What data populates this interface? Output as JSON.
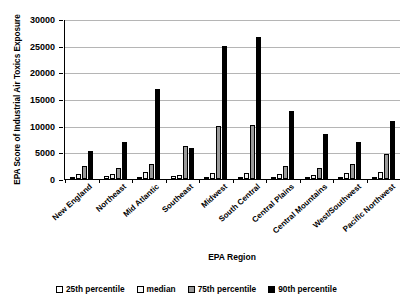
{
  "chart_data": {
    "type": "bar",
    "title": "",
    "xlabel": "EPA Region",
    "ylabel": "EPA Score of Industrial Air Toxics Exposure",
    "ylim": [
      0,
      30000
    ],
    "yticks": [
      0,
      5000,
      10000,
      15000,
      20000,
      25000,
      30000
    ],
    "ytick_labels": [
      "0",
      "5000",
      "10000",
      "15000",
      "20000",
      "25000",
      "30000"
    ],
    "grid": true,
    "legend_position": "bottom",
    "categories": [
      "New England",
      "Northeast",
      "Mid Atlantic",
      "Southeast",
      "Midwest",
      "South Central",
      "Central Plains",
      "Central Mountains",
      "West/Southwest",
      "Pacific Northwest"
    ],
    "series": [
      {
        "name": "25th percentile",
        "color": "#ffffff",
        "values": [
          400,
          600,
          400,
          500,
          200,
          300,
          400,
          200,
          300,
          400
        ]
      },
      {
        "name": "median",
        "color": "#f2f2f2",
        "values": [
          900,
          1000,
          1300,
          800,
          1100,
          1200,
          1000,
          800,
          1200,
          1300
        ]
      },
      {
        "name": "75th percentile",
        "color": "#9a9a9a",
        "values": [
          2400,
          2100,
          2800,
          6100,
          10000,
          10100,
          2500,
          2000,
          2800,
          4700
        ]
      },
      {
        "name": "90th percentile",
        "color": "#000000",
        "values": [
          5300,
          7000,
          16900,
          5800,
          25000,
          26700,
          12800,
          8500,
          6900,
          10800
        ]
      }
    ]
  },
  "legend": {
    "items": [
      {
        "label": "25th percentile",
        "swatch": "p25"
      },
      {
        "label": "median",
        "swatch": "med"
      },
      {
        "label": "75th percentile",
        "swatch": "p75"
      },
      {
        "label": "90th percentile",
        "swatch": "p90"
      }
    ]
  }
}
